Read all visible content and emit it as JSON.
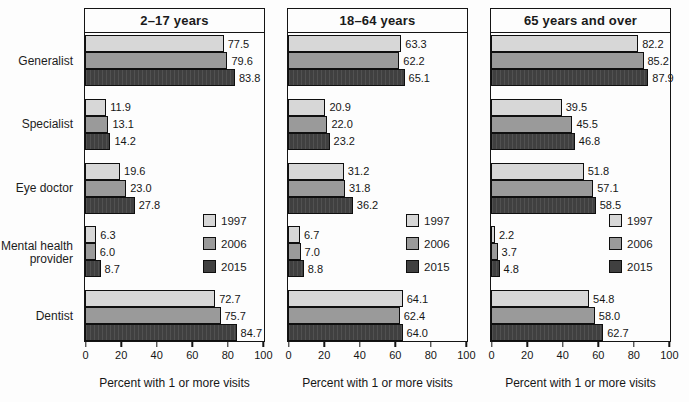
{
  "chart_data": {
    "type": "bar",
    "orientation": "horizontal",
    "title": "",
    "categories": [
      "Generalist",
      "Specialist",
      "Eye doctor",
      "Mental health\nprovider",
      "Dentist"
    ],
    "series_names": [
      "1997",
      "2006",
      "2015"
    ],
    "series_colors": {
      "1997": "#d7d7d7",
      "2006": "#9a9a9a",
      "2015": "#404040"
    },
    "xlabel": "Percent with 1 or more visits",
    "xlim": [
      0,
      100
    ],
    "x_ticks": [
      "0",
      "20",
      "40",
      "60",
      "80",
      "100"
    ],
    "grid": false,
    "legend_position": "inside-right-middle",
    "panels": [
      {
        "title": "2–17 years",
        "values": [
          [
            "77.5",
            "79.6",
            "83.8"
          ],
          [
            "11.9",
            "13.1",
            "14.2"
          ],
          [
            "19.6",
            "23.0",
            "27.8"
          ],
          [
            "6.3",
            "6.0",
            "8.7"
          ],
          [
            "72.7",
            "75.7",
            "84.7"
          ]
        ]
      },
      {
        "title": "18–64 years",
        "values": [
          [
            "63.3",
            "62.2",
            "65.1"
          ],
          [
            "20.9",
            "22.0",
            "23.2"
          ],
          [
            "31.2",
            "31.8",
            "36.2"
          ],
          [
            "6.7",
            "7.0",
            "8.8"
          ],
          [
            "64.1",
            "62.4",
            "64.0"
          ]
        ]
      },
      {
        "title": "65 years and over",
        "values": [
          [
            "82.2",
            "85.2",
            "87.9"
          ],
          [
            "39.5",
            "45.5",
            "46.8"
          ],
          [
            "51.8",
            "57.1",
            "58.5"
          ],
          [
            "2.2",
            "3.7",
            "4.8"
          ],
          [
            "54.8",
            "58.0",
            "62.7"
          ]
        ]
      }
    ]
  }
}
